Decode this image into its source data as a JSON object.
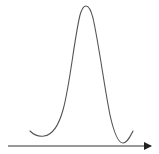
{
  "diagram": {
    "type": "bell-curve-sketch",
    "curve_color": "#555555",
    "axis_color": "#333333",
    "curve": {
      "start": [
        30,
        131
      ],
      "left_min": [
        42,
        136
      ],
      "peak": [
        85,
        6
      ],
      "right_min": [
        122,
        143
      ],
      "end": [
        133,
        131
      ]
    },
    "axis": {
      "from": [
        8,
        146
      ],
      "to": [
        152,
        146
      ],
      "arrowhead": "right"
    }
  }
}
